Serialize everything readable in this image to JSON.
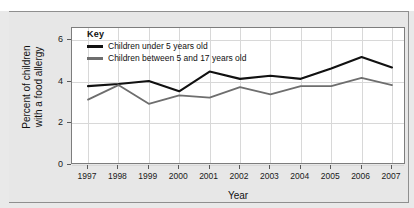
{
  "chart_data": {
    "type": "line",
    "title": "",
    "xlabel": "Year",
    "ylabel": "Percent of children\nwith a food allergy",
    "categories": [
      "1997",
      "1998",
      "1999",
      "2000",
      "2001",
      "2002",
      "2003",
      "2004",
      "2005",
      "2006",
      "2007"
    ],
    "x": [
      1997,
      1998,
      1999,
      2000,
      2001,
      2002,
      2003,
      2004,
      2005,
      2006,
      2007
    ],
    "ylim": [
      0,
      6.6
    ],
    "yticks": [
      0,
      2,
      4,
      6
    ],
    "ytick_labels": [
      "0",
      "2",
      "4",
      "6"
    ],
    "grid": true,
    "legend_position": "top-left-inside",
    "series": [
      {
        "name": "Children under 5 years old",
        "color": "#111111",
        "values": [
          3.8,
          3.9,
          4.05,
          3.55,
          4.5,
          4.15,
          4.3,
          4.15,
          4.65,
          5.2,
          4.7
        ]
      },
      {
        "name": "Children between 5 and 17 years old",
        "color": "#6e6e6e",
        "values": [
          3.15,
          3.85,
          2.95,
          3.35,
          3.25,
          3.75,
          3.4,
          3.8,
          3.8,
          4.2,
          3.85
        ]
      }
    ]
  },
  "legend": {
    "title": "Key",
    "items": [
      {
        "label": "Children under 5 years old",
        "color": "#111111"
      },
      {
        "label": "Children between 5 and 17 years old",
        "color": "#6e6e6e"
      }
    ]
  },
  "axes": {
    "y_label": "Percent of children\nwith a food allergy",
    "x_label": "Year"
  }
}
